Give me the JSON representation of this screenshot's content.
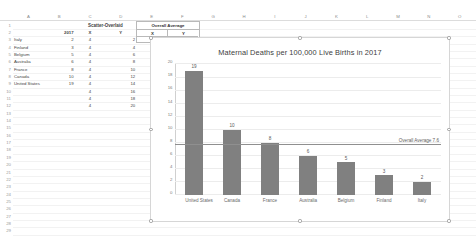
{
  "app": {
    "columns": [
      "A",
      "B",
      "C",
      "D",
      "E",
      "F",
      "G",
      "H",
      "I",
      "J",
      "K",
      "L",
      "M",
      "N",
      "O"
    ],
    "rows": [
      1,
      2,
      3,
      4,
      5,
      6,
      7,
      8,
      9,
      10,
      11,
      12,
      13,
      14,
      15,
      16,
      17,
      18,
      19,
      20,
      21,
      22,
      23,
      24,
      25,
      26,
      27,
      28,
      29
    ]
  },
  "sheet": {
    "group_headers": {
      "scatter_overlaid": "Scatter-Overlaid",
      "overall_average": "Overall Average"
    },
    "col_headers": {
      "b": "2017",
      "c": "X",
      "d": "Y",
      "e": "X",
      "f": "Y"
    },
    "countries": [
      "Italy",
      "Finland",
      "Belgium",
      "Australia",
      "France",
      "Canada",
      "United States"
    ],
    "values_2017": [
      "2",
      "3",
      "5",
      "6",
      "8",
      "10",
      "19"
    ],
    "scatter_x": [
      "4",
      "4",
      "4",
      "4",
      "4",
      "4",
      "4",
      "4",
      "4",
      "4"
    ],
    "scatter_y": [
      "2",
      "4",
      "6",
      "8",
      "10",
      "12",
      "14",
      "16",
      "18",
      "20"
    ],
    "average_point": {
      "x": "4",
      "y": "7.6"
    }
  },
  "chart_data": {
    "type": "bar",
    "title": "Maternal Deaths per 100,000 Live Births in 2017",
    "xlabel": "",
    "ylabel": "",
    "categories": [
      "United States",
      "Canada",
      "France",
      "Australia",
      "Belgium",
      "Finland",
      "Italy"
    ],
    "values": [
      19,
      10,
      8,
      6,
      5,
      3,
      2
    ],
    "data_labels": [
      "19",
      "10",
      "8",
      "6",
      "5",
      "3",
      "2"
    ],
    "ylim": [
      0,
      20
    ],
    "yticks": [
      "0",
      "2",
      "4",
      "6",
      "8",
      "10",
      "12",
      "14",
      "16",
      "18",
      "20"
    ],
    "grid": true,
    "legend": "none",
    "bar_color": "#808080",
    "annotations": [
      {
        "name": "overall-average-line",
        "label": "Overall Average 7.6",
        "value": 7.6
      }
    ]
  }
}
